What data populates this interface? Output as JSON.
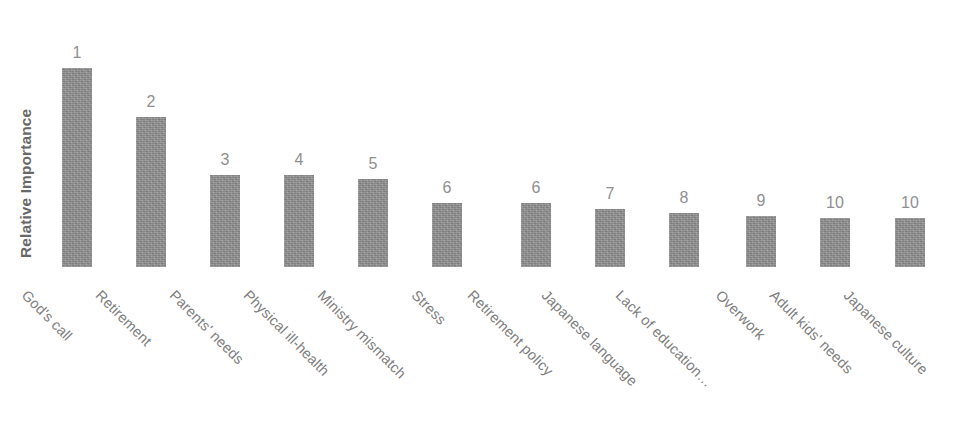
{
  "chart_data": {
    "type": "bar",
    "title": "",
    "xlabel": "",
    "ylabel": "Relative Importance",
    "grid": false,
    "legend": "none",
    "orientation": "vertical",
    "value_label_type": "rank",
    "categories": [
      "God's call",
      "Retirement",
      "Parents' needs",
      "Physical ill-health",
      "Ministry mismatch",
      "Stress",
      "Retirement policy",
      "Japanese language",
      "Lack of education…",
      "Overwork",
      "Adult kids' needs",
      "Japanese culture"
    ],
    "values": [
      199,
      150,
      92,
      92,
      88,
      64,
      64,
      58,
      54,
      51,
      49,
      49
    ],
    "rank_labels": [
      "1",
      "2",
      "3",
      "4",
      "5",
      "6",
      "6",
      "7",
      "8",
      "9",
      "10",
      "10"
    ],
    "ylim": [
      0,
      215
    ],
    "bar_color": "#8d8d8d",
    "text_color": "#7d7d7d",
    "axis_title_color": "#686868"
  },
  "axis": {
    "y_title": "Relative Importance"
  },
  "header": {
    "title_fragment": ""
  },
  "bars": [
    {
      "category": "God's call",
      "rank": "1",
      "height": 199,
      "x": 62,
      "color": "#8d8d8d"
    },
    {
      "category": "Retirement",
      "rank": "2",
      "height": 150,
      "x": 136,
      "color": "#8d8d8d"
    },
    {
      "category": "Parents' needs",
      "rank": "3",
      "height": 92,
      "x": 210,
      "color": "#8d8d8d"
    },
    {
      "category": "Physical ill-health",
      "rank": "4",
      "height": 92,
      "x": 284,
      "color": "#8d8d8d"
    },
    {
      "category": "Ministry mismatch",
      "rank": "5",
      "height": 88,
      "x": 358,
      "color": "#8d8d8d"
    },
    {
      "category": "Stress",
      "rank": "6",
      "height": 64,
      "x": 432,
      "color": "#8d8d8d"
    },
    {
      "category": "Retirement policy",
      "rank": "6",
      "height": 64,
      "x": 521,
      "color": "#8d8d8d"
    },
    {
      "category": "Japanese language",
      "rank": "7",
      "height": 58,
      "x": 595,
      "color": "#8d8d8d"
    },
    {
      "category": "Lack of education…",
      "rank": "8",
      "height": 54,
      "x": 669,
      "color": "#8d8d8d"
    },
    {
      "category": "Overwork",
      "rank": "9",
      "height": 51,
      "x": 746,
      "color": "#8d8d8d"
    },
    {
      "category": "Adult kids' needs",
      "rank": "10",
      "height": 49,
      "x": 820,
      "color": "#8d8d8d"
    },
    {
      "category": "Japanese culture",
      "rank": "10",
      "height": 49,
      "x": 895,
      "color": "#8d8d8d"
    }
  ],
  "category_label_anchors": [
    {
      "x": 30,
      "y": 20
    },
    {
      "x": 104,
      "y": 20
    },
    {
      "x": 178,
      "y": 20
    },
    {
      "x": 252,
      "y": 20
    },
    {
      "x": 326,
      "y": 20
    },
    {
      "x": 420,
      "y": 20
    },
    {
      "x": 476,
      "y": 20
    },
    {
      "x": 550,
      "y": 20
    },
    {
      "x": 624,
      "y": 20
    },
    {
      "x": 724,
      "y": 20
    },
    {
      "x": 778,
      "y": 20
    },
    {
      "x": 852,
      "y": 20
    }
  ]
}
